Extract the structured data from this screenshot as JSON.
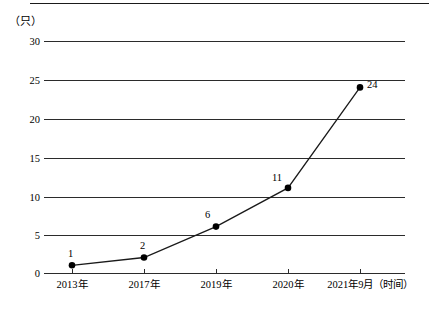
{
  "chart_data": {
    "type": "line",
    "title": "",
    "subtitle": "",
    "unit_label": "（只）",
    "xlabel": "时间",
    "ylabel": "只",
    "categories": [
      "2013年",
      "2017年",
      "2019年",
      "2020年",
      "2021年9月"
    ],
    "x_axis_suffix": "（时间）",
    "x_tick_labels": [
      "2013年",
      "2017年",
      "2019年",
      "2020年",
      "2021年9月（时间）"
    ],
    "values": [
      1,
      2,
      6,
      11,
      24
    ],
    "point_labels": [
      "1",
      "2",
      "6",
      "11",
      "24"
    ],
    "y_ticks": [
      "0",
      "5",
      "10",
      "15",
      "20",
      "25",
      "30"
    ],
    "ylim": [
      0,
      30
    ],
    "grid": true,
    "legend": "none",
    "marker": "filled-circle",
    "line_color": "#1a1a1a",
    "marker_color": "#000000",
    "grid_color": "#2b2b2b",
    "background_color": "#ffffff"
  }
}
